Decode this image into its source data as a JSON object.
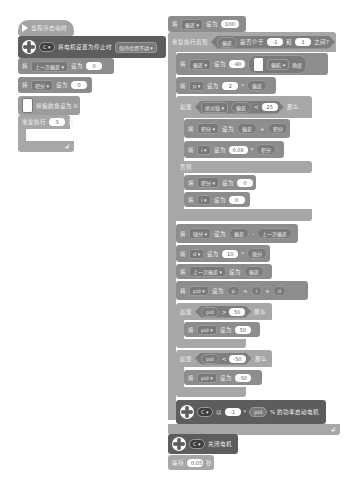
{
  "left_stack": {
    "hat": {
      "label": "当程序启动时"
    },
    "stop_mode": {
      "port": "C",
      "label": "将电机设置为停止时",
      "mode": "保持位置不动"
    },
    "set_last_error": {
      "prefix": "将",
      "var": "上一次偏差",
      "set_to": "设为",
      "value": "0"
    },
    "set_integral": {
      "prefix": "将",
      "var": "积分",
      "set_to": "设为",
      "value": "0"
    },
    "reset_yaw": {
      "label": "将偏航角设为 0"
    },
    "repeat": {
      "prefix": "重复执行",
      "value": "3",
      "suffix": "次"
    }
  },
  "right_stack": {
    "set_error_init": {
      "prefix": "将",
      "var": "偏差",
      "set_to": "设为",
      "value": "100"
    },
    "repeat_until": {
      "label": "重复执行直到",
      "reporter": "偏差",
      "between": "是否介于",
      "low": "-1",
      "and": "和",
      "high": "1",
      "end": "之间?"
    },
    "set_error_yaw": {
      "prefix": "将",
      "var": "偏差",
      "set_to": "设为",
      "value": "-90",
      "sensor": "偏航",
      "sensor_suffix": "角度"
    },
    "set_p": {
      "prefix": "将",
      "var": "p",
      "set_to": "设为",
      "coef": "2",
      "op": "*",
      "operand": "偏差"
    },
    "if_abs": {
      "label": "如果",
      "func": "绝对值",
      "operand": "偏差",
      "op": "<",
      "value": "25",
      "then": "那么"
    },
    "set_integral_sum": {
      "prefix": "将",
      "var": "积分",
      "set_to": "设为",
      "a": "偏差",
      "op": "+",
      "b": "积分"
    },
    "set_i": {
      "prefix": "将",
      "var": "i",
      "set_to": "设为",
      "coef": "0.08",
      "op": "*",
      "operand": "积分"
    },
    "else": {
      "label": "否则"
    },
    "reset_integral": {
      "prefix": "将",
      "var": "积分",
      "set_to": "设为",
      "value": "0"
    },
    "reset_i": {
      "prefix": "将",
      "var": "i",
      "set_to": "设为",
      "value": "0"
    },
    "set_derivative": {
      "prefix": "将",
      "var": "微分",
      "set_to": "设为",
      "a": "偏差",
      "op": "-",
      "b": "上一次偏差"
    },
    "set_d": {
      "prefix": "将",
      "var": "d",
      "set_to": "设为",
      "coef": "10",
      "op": "*",
      "operand": "微分"
    },
    "set_last": {
      "prefix": "将",
      "var": "上一次偏差",
      "set_to": "设为",
      "value": "偏差"
    },
    "set_pid": {
      "prefix": "将",
      "var": "pid",
      "set_to": "设为",
      "a": "p",
      "op1": "+",
      "b": "i",
      "op2": "+",
      "c": "d"
    },
    "if_high": {
      "label": "如果",
      "var": "pid",
      "op": ">",
      "value": "50",
      "then": "那么"
    },
    "clamp_high": {
      "prefix": "将",
      "var": "pid",
      "set_to": "设为",
      "value": "50"
    },
    "if_low": {
      "label": "如果",
      "var": "pid",
      "op": "<",
      "value": "-50",
      "then": "那么"
    },
    "clamp_low": {
      "prefix": "将",
      "var": "pid",
      "set_to": "设为",
      "value": "-50"
    },
    "start_motor": {
      "port": "C",
      "with": "以",
      "coef": "-1",
      "op": "*",
      "var": "pid",
      "suffix": "% 的功率启动电机"
    },
    "stop_motor": {
      "port": "C",
      "label": "关闭电机"
    },
    "wait": {
      "prefix": "等待",
      "value": "0.05",
      "suffix": "秒"
    }
  }
}
